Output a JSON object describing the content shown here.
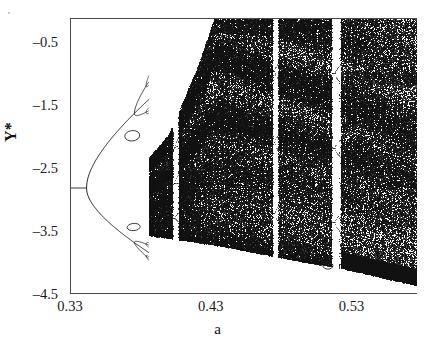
{
  "figure": {
    "kind": "bifurcation-diagram",
    "background": "#ffffff",
    "point_color": "#111111"
  },
  "axes": {
    "x_title": "a",
    "y_title": "Y*",
    "x_ticklabels": [
      "0.33",
      "0.43",
      "0.53"
    ],
    "y_ticklabels": [
      "-0.5",
      "-1.5",
      "-2.5",
      "-3.5",
      "-4.5"
    ]
  },
  "chart_data": {
    "type": "scatter",
    "title": "",
    "subtitle": "",
    "xlabel": "a",
    "ylabel": "Y*",
    "xlim": [
      0.33,
      0.5765
    ],
    "ylim": [
      -4.5,
      -0.115
    ],
    "grid": false,
    "legend": null,
    "x_ticks": [
      0.33,
      0.43,
      0.53
    ],
    "x_minor_ticks": [
      0.38,
      0.48
    ],
    "y_ticks": [
      -0.5,
      -1.5,
      -2.5,
      -3.5,
      -4.5
    ],
    "y_minor_ticks": [
      -1.0,
      -2.0,
      -3.0,
      -4.0
    ],
    "x_ticklabels": [
      "0.33",
      "0.43",
      "0.53"
    ],
    "y_ticklabels": [
      "-0.5",
      "-1.5",
      "-2.5",
      "-3.5",
      "-4.5"
    ],
    "fixed_point_value": -2.8,
    "first_bifurcation_a": 0.341,
    "second_bifurcation_a": 0.375,
    "accumulation_a": 0.3855,
    "chaos_onset_a": 0.386,
    "periodic_windows_a": [
      0.4045,
      0.4755,
      0.5185
    ],
    "upper_envelope": [
      {
        "a": 0.386,
        "y": -2.32
      },
      {
        "a": 0.4,
        "y": -1.95
      },
      {
        "a": 0.42,
        "y": -0.9
      },
      {
        "a": 0.432,
        "y": -0.12
      },
      {
        "a": 0.5765,
        "y": -0.12
      }
    ],
    "lower_envelope": [
      {
        "a": 0.33,
        "y": -2.8
      },
      {
        "a": 0.341,
        "y": -2.8
      },
      {
        "a": 0.375,
        "y": -3.4
      },
      {
        "a": 0.386,
        "y": -3.56
      },
      {
        "a": 0.43,
        "y": -3.7
      },
      {
        "a": 0.5,
        "y": -4.0
      },
      {
        "a": 0.5185,
        "y": -4.06
      },
      {
        "a": 0.5765,
        "y": -4.36
      }
    ],
    "series": [
      {
        "name": "attractor",
        "note": "dense set of iterates of the map sampled at every a; rendered as a point cloud"
      }
    ]
  }
}
